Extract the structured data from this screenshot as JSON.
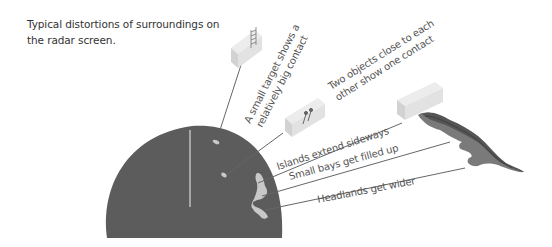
{
  "caption": {
    "line1": "Typical distortions of surroundings on",
    "line2": "the radar screen."
  },
  "labels": {
    "small_target_1": "A small target shows a",
    "small_target_2": "relatively big contact",
    "two_objects_1": "Two objects close to each",
    "two_objects_2": "other show one contact",
    "islands": "Islands extend sideways",
    "bays": "Small bays get filled up",
    "headlands": "Headlands get wider"
  },
  "icons": {
    "small_target": "ladder-icon",
    "two_objects": "two-pins-icon"
  },
  "colors": {
    "radar_screen": "#5c5c5c",
    "radar_echo": "#c8c8c8",
    "object_box": "#e2e2e2",
    "land_dark": "#555555",
    "land_mid": "#777777",
    "leader_line": "#666666",
    "text": "#555555"
  }
}
